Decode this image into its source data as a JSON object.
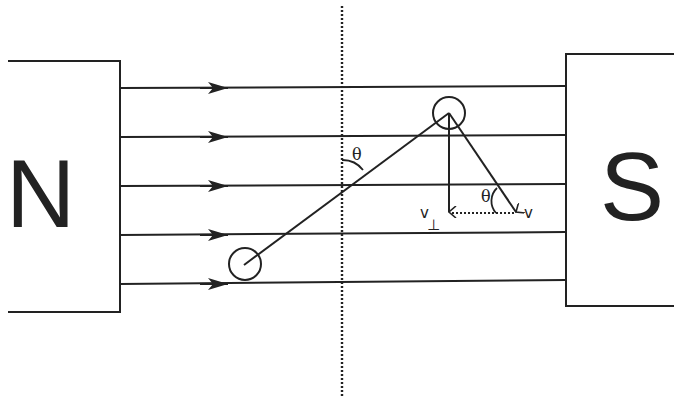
{
  "diagram": {
    "poles": {
      "north": {
        "label": "N"
      },
      "south": {
        "label": "S"
      }
    },
    "field_lines": {
      "count": 5,
      "direction": "left-to-right"
    },
    "labels": {
      "theta_rod": "θ",
      "theta_velocity": "θ",
      "v_perp": "v",
      "v_perp_sub": "⊥",
      "v": "v"
    },
    "colors": {
      "ink": "#222222",
      "background": "#ffffff"
    }
  }
}
